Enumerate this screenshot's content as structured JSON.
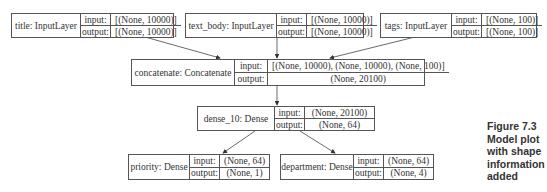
{
  "diagram": {
    "nodes": [
      {
        "id": "title",
        "name": "title: InputLayer",
        "input_label": "input:",
        "output_label": "output:",
        "input": "[(None, 10000)]",
        "output": "[(None, 10000)]"
      },
      {
        "id": "text_body",
        "name": "text_body: InputLayer",
        "input_label": "input:",
        "output_label": "output:",
        "input": "[(None, 10000)]",
        "output": "[(None, 10000)]"
      },
      {
        "id": "tags",
        "name": "tags: InputLayer",
        "input_label": "input:",
        "output_label": "output:",
        "input": "[(None, 100)]",
        "output": "[(None, 100)]"
      },
      {
        "id": "concatenate",
        "name": "concatenate: Concatenate",
        "input_label": "input:",
        "output_label": "output:",
        "input": "[(None, 10000), (None, 10000), (None, 100)]",
        "output": "(None, 20100)"
      },
      {
        "id": "dense_10",
        "name": "dense_10: Dense",
        "input_label": "input:",
        "output_label": "output:",
        "input": "(None, 20100)",
        "output": "(None, 64)"
      },
      {
        "id": "priority",
        "name": "priority: Dense",
        "input_label": "input:",
        "output_label": "output:",
        "input": "(None, 64)",
        "output": "(None, 1)"
      },
      {
        "id": "department",
        "name": "department: Dense",
        "input_label": "input:",
        "output_label": "output:",
        "input": "(None, 64)",
        "output": "(None, 4)"
      }
    ],
    "edges": [
      {
        "from": "title",
        "to": "concatenate"
      },
      {
        "from": "text_body",
        "to": "concatenate"
      },
      {
        "from": "tags",
        "to": "concatenate"
      },
      {
        "from": "concatenate",
        "to": "dense_10"
      },
      {
        "from": "dense_10",
        "to": "priority"
      },
      {
        "from": "dense_10",
        "to": "department"
      }
    ]
  },
  "caption": {
    "line1": "Figure 7.3",
    "line2": "Model plot",
    "line3": "with shape",
    "line4": "information",
    "line5": "added"
  }
}
